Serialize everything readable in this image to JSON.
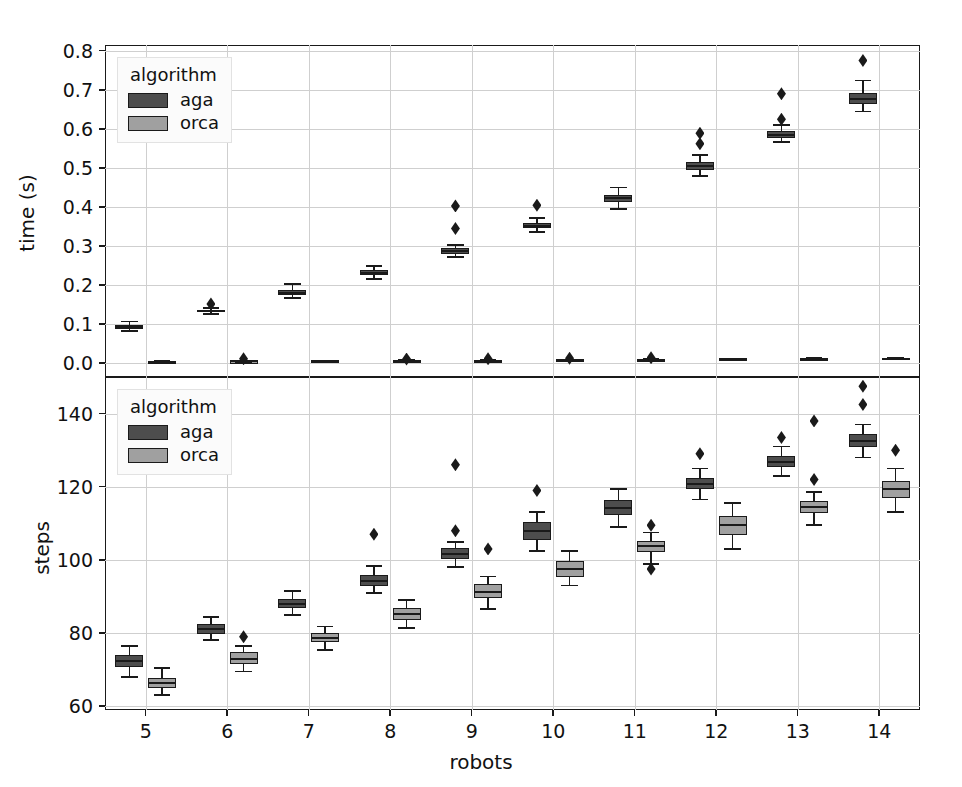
{
  "figure": {
    "width": 962,
    "height": 787,
    "background": "#ffffff"
  },
  "colors": {
    "aga": "#4d4d4d",
    "orca": "#a0a0a0",
    "line": "#1a1a1a",
    "grid": "#cfcfcf",
    "legend_bg": "#fbfbfb"
  },
  "legend": {
    "title": "algorithm",
    "entries": [
      {
        "label": "aga",
        "color": "#4d4d4d"
      },
      {
        "label": "orca",
        "color": "#a0a0a0"
      }
    ]
  },
  "chart_data": [
    {
      "id": "time-panel",
      "type": "box",
      "title": "",
      "xlabel": "",
      "ylabel": "time (s)",
      "grid": true,
      "legend_position": "upper left",
      "categories": [
        5,
        6,
        7,
        8,
        9,
        10,
        11,
        12,
        13,
        14
      ],
      "xlim": [
        4.5,
        14.5
      ],
      "ylim": [
        -0.035,
        0.815
      ],
      "yticks": [
        0.0,
        0.1,
        0.2,
        0.3,
        0.4,
        0.5,
        0.6,
        0.7,
        0.8
      ],
      "ytick_labels": [
        "0.0",
        "0.1",
        "0.2",
        "0.3",
        "0.4",
        "0.5",
        "0.6",
        "0.7",
        "0.8"
      ],
      "series": [
        {
          "name": "aga",
          "color": "#4d4d4d",
          "boxes": [
            {
              "x": 5,
              "whisker_low": 0.082,
              "q1": 0.088,
              "median": 0.093,
              "q3": 0.099,
              "whisker_high": 0.107,
              "fliers": []
            },
            {
              "x": 6,
              "whisker_low": 0.127,
              "q1": 0.131,
              "median": 0.134,
              "q3": 0.137,
              "whisker_high": 0.142,
              "fliers": [
                0.152
              ]
            },
            {
              "x": 7,
              "whisker_low": 0.168,
              "q1": 0.176,
              "median": 0.181,
              "q3": 0.188,
              "whisker_high": 0.203,
              "fliers": []
            },
            {
              "x": 8,
              "whisker_low": 0.215,
              "q1": 0.226,
              "median": 0.231,
              "q3": 0.238,
              "whisker_high": 0.25,
              "fliers": []
            },
            {
              "x": 9,
              "whisker_low": 0.272,
              "q1": 0.281,
              "median": 0.287,
              "q3": 0.294,
              "whisker_high": 0.302,
              "fliers": [
                0.345,
                0.403
              ]
            },
            {
              "x": 10,
              "whisker_low": 0.337,
              "q1": 0.347,
              "median": 0.352,
              "q3": 0.36,
              "whisker_high": 0.372,
              "fliers": [
                0.405
              ]
            },
            {
              "x": 11,
              "whisker_low": 0.395,
              "q1": 0.414,
              "median": 0.423,
              "q3": 0.432,
              "whisker_high": 0.45,
              "fliers": []
            },
            {
              "x": 12,
              "whisker_low": 0.48,
              "q1": 0.496,
              "median": 0.504,
              "q3": 0.515,
              "whisker_high": 0.533,
              "fliers": [
                0.562,
                0.589
              ]
            },
            {
              "x": 13,
              "whisker_low": 0.566,
              "q1": 0.578,
              "median": 0.585,
              "q3": 0.594,
              "whisker_high": 0.611,
              "fliers": [
                0.625,
                0.69
              ]
            },
            {
              "x": 14,
              "whisker_low": 0.645,
              "q1": 0.665,
              "median": 0.678,
              "q3": 0.691,
              "whisker_high": 0.724,
              "fliers": [
                0.775
              ]
            }
          ]
        },
        {
          "name": "orca",
          "color": "#a0a0a0",
          "boxes": [
            {
              "x": 5,
              "whisker_low": 0.003,
              "q1": 0.004,
              "median": 0.004,
              "q3": 0.005,
              "whisker_high": 0.006,
              "fliers": []
            },
            {
              "x": 6,
              "whisker_low": 0.003,
              "q1": 0.004,
              "median": 0.005,
              "q3": 0.005,
              "whisker_high": 0.007,
              "fliers": [
                0.012
              ]
            },
            {
              "x": 7,
              "whisker_low": 0.004,
              "q1": 0.005,
              "median": 0.005,
              "q3": 0.006,
              "whisker_high": 0.007,
              "fliers": []
            },
            {
              "x": 8,
              "whisker_low": 0.004,
              "q1": 0.005,
              "median": 0.006,
              "q3": 0.007,
              "whisker_high": 0.008,
              "fliers": [
                0.011
              ]
            },
            {
              "x": 9,
              "whisker_low": 0.005,
              "q1": 0.006,
              "median": 0.007,
              "q3": 0.008,
              "whisker_high": 0.009,
              "fliers": [
                0.012
              ]
            },
            {
              "x": 10,
              "whisker_low": 0.006,
              "q1": 0.007,
              "median": 0.008,
              "q3": 0.009,
              "whisker_high": 0.01,
              "fliers": [
                0.013
              ]
            },
            {
              "x": 11,
              "whisker_low": 0.007,
              "q1": 0.008,
              "median": 0.009,
              "q3": 0.01,
              "whisker_high": 0.011,
              "fliers": [
                0.014
              ]
            },
            {
              "x": 12,
              "whisker_low": 0.008,
              "q1": 0.009,
              "median": 0.01,
              "q3": 0.011,
              "whisker_high": 0.012,
              "fliers": []
            },
            {
              "x": 13,
              "whisker_low": 0.009,
              "q1": 0.01,
              "median": 0.011,
              "q3": 0.012,
              "whisker_high": 0.014,
              "fliers": []
            },
            {
              "x": 14,
              "whisker_low": 0.01,
              "q1": 0.011,
              "median": 0.012,
              "q3": 0.014,
              "whisker_high": 0.015,
              "fliers": []
            }
          ]
        }
      ]
    },
    {
      "id": "steps-panel",
      "type": "box",
      "title": "",
      "xlabel": "robots",
      "ylabel": "steps",
      "grid": true,
      "legend_position": "upper left",
      "categories": [
        5,
        6,
        7,
        8,
        9,
        10,
        11,
        12,
        13,
        14
      ],
      "xlim": [
        4.5,
        14.5
      ],
      "ylim": [
        59,
        150
      ],
      "yticks": [
        60,
        80,
        100,
        120,
        140
      ],
      "ytick_labels": [
        "60",
        "80",
        "100",
        "120",
        "140"
      ],
      "xtick_labels": [
        "5",
        "6",
        "7",
        "8",
        "9",
        "10",
        "11",
        "12",
        "13",
        "14"
      ],
      "series": [
        {
          "name": "aga",
          "color": "#4d4d4d",
          "boxes": [
            {
              "x": 5,
              "whisker_low": 68.0,
              "q1": 70.8,
              "median": 72.3,
              "q3": 74.0,
              "whisker_high": 76.5,
              "fliers": []
            },
            {
              "x": 6,
              "whisker_low": 78.2,
              "q1": 79.8,
              "median": 81.2,
              "q3": 82.5,
              "whisker_high": 84.5,
              "fliers": []
            },
            {
              "x": 7,
              "whisker_low": 85.0,
              "q1": 86.8,
              "median": 88.0,
              "q3": 89.3,
              "whisker_high": 91.5,
              "fliers": []
            },
            {
              "x": 8,
              "whisker_low": 91.0,
              "q1": 93.0,
              "median": 94.2,
              "q3": 95.8,
              "whisker_high": 98.3,
              "fliers": [
                107.0
              ]
            },
            {
              "x": 9,
              "whisker_low": 98.0,
              "q1": 100.2,
              "median": 101.6,
              "q3": 103.2,
              "whisker_high": 105.0,
              "fliers": [
                108.0,
                126.0
              ]
            },
            {
              "x": 10,
              "whisker_low": 102.5,
              "q1": 105.5,
              "median": 108.0,
              "q3": 110.3,
              "whisker_high": 113.0,
              "fliers": [
                119.0
              ]
            },
            {
              "x": 11,
              "whisker_low": 109.0,
              "q1": 112.3,
              "median": 114.3,
              "q3": 116.3,
              "whisker_high": 119.5,
              "fliers": []
            },
            {
              "x": 12,
              "whisker_low": 116.5,
              "q1": 119.3,
              "median": 120.8,
              "q3": 122.5,
              "whisker_high": 125.0,
              "fliers": [
                129.0
              ]
            },
            {
              "x": 13,
              "whisker_low": 123.0,
              "q1": 125.5,
              "median": 126.8,
              "q3": 128.3,
              "whisker_high": 131.0,
              "fliers": [
                133.5
              ]
            },
            {
              "x": 14,
              "whisker_low": 128.0,
              "q1": 130.8,
              "median": 132.5,
              "q3": 134.3,
              "whisker_high": 137.0,
              "fliers": [
                142.5,
                147.5
              ]
            }
          ]
        },
        {
          "name": "orca",
          "color": "#a0a0a0",
          "boxes": [
            {
              "x": 5,
              "whisker_low": 63.0,
              "q1": 65.0,
              "median": 66.3,
              "q3": 67.8,
              "whisker_high": 70.5,
              "fliers": []
            },
            {
              "x": 6,
              "whisker_low": 69.5,
              "q1": 71.5,
              "median": 73.0,
              "q3": 74.8,
              "whisker_high": 76.5,
              "fliers": [
                79.0
              ]
            },
            {
              "x": 7,
              "whisker_low": 75.5,
              "q1": 77.5,
              "median": 78.8,
              "q3": 80.0,
              "whisker_high": 81.8,
              "fliers": []
            },
            {
              "x": 8,
              "whisker_low": 81.5,
              "q1": 83.5,
              "median": 85.2,
              "q3": 87.0,
              "whisker_high": 89.0,
              "fliers": []
            },
            {
              "x": 9,
              "whisker_low": 86.5,
              "q1": 89.5,
              "median": 91.3,
              "q3": 93.3,
              "whisker_high": 95.5,
              "fliers": [
                103.0
              ]
            },
            {
              "x": 10,
              "whisker_low": 93.0,
              "q1": 95.3,
              "median": 97.5,
              "q3": 99.8,
              "whisker_high": 102.5,
              "fliers": []
            },
            {
              "x": 11,
              "whisker_low": 99.0,
              "q1": 102.3,
              "median": 103.8,
              "q3": 105.3,
              "whisker_high": 107.5,
              "fliers": [
                97.5,
                109.5
              ]
            },
            {
              "x": 12,
              "whisker_low": 103.0,
              "q1": 106.8,
              "median": 109.5,
              "q3": 112.0,
              "whisker_high": 115.5,
              "fliers": []
            },
            {
              "x": 13,
              "whisker_low": 109.5,
              "q1": 112.8,
              "median": 114.5,
              "q3": 116.0,
              "whisker_high": 118.5,
              "fliers": [
                122.0,
                138.0
              ]
            },
            {
              "x": 14,
              "whisker_low": 113.0,
              "q1": 117.0,
              "median": 119.3,
              "q3": 121.5,
              "whisker_high": 125.0,
              "fliers": [
                130.0
              ]
            }
          ]
        }
      ]
    }
  ]
}
